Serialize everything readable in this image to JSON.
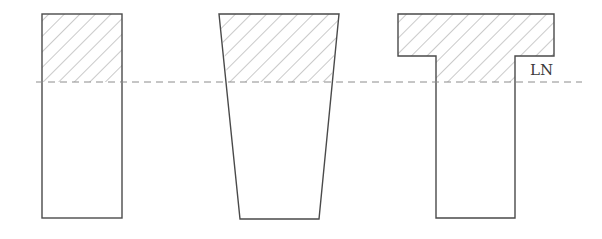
{
  "diagram": {
    "neutral_axis_label": "LN",
    "colors": {
      "outline": "#4a4a4a",
      "hatch": "#8a8a8a",
      "neutral_axis": "#8c8c8c",
      "background": "#ffffff"
    },
    "sections": [
      {
        "name": "rectangular",
        "hatched_zone": "compression"
      },
      {
        "name": "trapezoidal",
        "hatched_zone": "compression"
      },
      {
        "name": "t-section",
        "hatched_zone": "compression"
      }
    ]
  }
}
